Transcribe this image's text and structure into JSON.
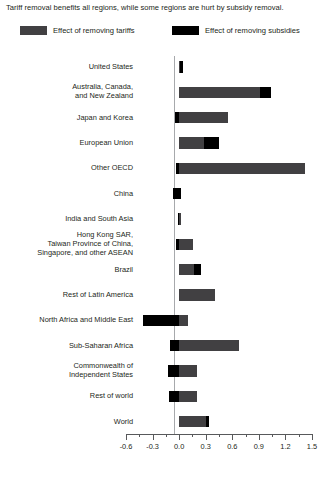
{
  "title": "Tariff removal benefits all regions, while some regions are hurt by subsidy removal.",
  "legend": {
    "items": [
      {
        "label": "Effect of removing tariffs",
        "color": "#414042",
        "key": "tariffs"
      },
      {
        "label": "Effect of removing subsidies",
        "color": "#000000",
        "key": "subsidies"
      }
    ]
  },
  "chart_data": {
    "type": "bar",
    "orientation": "horizontal",
    "stacked": true,
    "title": "Tariff removal benefits all regions, while some regions are hurt by subsidy removal.",
    "xlabel": "",
    "ylabel": "",
    "xlim": [
      -0.6,
      1.5
    ],
    "xticks": [
      "-0.6",
      "-0.3",
      "0.0",
      "0.3",
      "0.6",
      "0.9",
      "1.2",
      "1.5"
    ],
    "xtick_values": [
      -0.6,
      -0.3,
      0.0,
      0.3,
      0.6,
      0.9,
      1.2,
      1.5
    ],
    "minor_tick_interval": 0.15,
    "grid": false,
    "legend_position": "top",
    "categories": [
      "United States",
      "Australia, Canada,\nand New Zealand",
      "Japan and Korea",
      "European Union",
      "Other OECD",
      "China",
      "India and South Asia",
      "Hong Kong SAR,\nTaiwan Province of China,\nSingapore, and other ASEAN",
      "Brazil",
      "Rest of Latin America",
      "North Africa and Middle East",
      "Sub-Saharan Africa",
      "Commonwealth of\nIndependent States",
      "Rest of world",
      "World"
    ],
    "series": [
      {
        "name": "Effect of removing tariffs",
        "color": "#414042",
        "values": [
          0.01,
          0.91,
          0.55,
          0.28,
          1.42,
          -0.01,
          0.02,
          0.16,
          0.17,
          0.41,
          0.09,
          0.68,
          0.2,
          0.2,
          0.3
        ]
      },
      {
        "name": "Effect of removing subsidies",
        "color": "#000000",
        "values": [
          0.03,
          0.13,
          -0.04,
          0.17,
          0.03,
          -0.06,
          0.01,
          0.0,
          0.07,
          0.0,
          -0.41,
          -0.1,
          -0.13,
          -0.11,
          0.03
        ]
      }
    ],
    "bars": [
      {
        "category": "United States",
        "gray_start": 0.0,
        "gray_end": 0.012,
        "black_start": 0.012,
        "black_end": 0.042
      },
      {
        "category": "Australia, Canada, and New Zealand",
        "gray_start": 0.0,
        "gray_end": 0.91,
        "black_start": 0.91,
        "black_end": 1.04
      },
      {
        "category": "Japan and Korea",
        "gray_start": 0.0,
        "gray_end": 0.55,
        "black_start": -0.045,
        "black_end": 0.0
      },
      {
        "category": "European Union",
        "gray_start": 0.0,
        "gray_end": 0.28,
        "black_start": 0.28,
        "black_end": 0.45
      },
      {
        "category": "Other OECD",
        "gray_start": 0.0,
        "gray_end": 1.42,
        "black_start": -0.03,
        "black_end": 0.0
      },
      {
        "category": "China",
        "gray_start": -0.01,
        "gray_end": 0.0,
        "black_start": -0.07,
        "black_end": 0.02
      },
      {
        "category": "India and South Asia",
        "gray_start": 0.0,
        "gray_end": 0.02,
        "black_start": -0.015,
        "black_end": 0.0
      },
      {
        "category": "Hong Kong SAR, Taiwan Province of China, Singapore, and other ASEAN",
        "gray_start": -0.03,
        "gray_end": 0.16,
        "black_start": -0.03,
        "black_end": 0.0
      },
      {
        "category": "Brazil",
        "gray_start": 0.0,
        "gray_end": 0.17,
        "black_start": 0.17,
        "black_end": 0.245
      },
      {
        "category": "Rest of Latin America",
        "gray_start": 0.0,
        "gray_end": 0.41,
        "black_start": 0.0,
        "black_end": 0.0
      },
      {
        "category": "North Africa and Middle East",
        "gray_start": 0.0,
        "gray_end": 0.095,
        "black_start": -0.41,
        "black_end": 0.0
      },
      {
        "category": "Sub-Saharan Africa",
        "gray_start": 0.0,
        "gray_end": 0.68,
        "black_start": -0.1,
        "black_end": 0.0
      },
      {
        "category": "Commonwealth of Independent States",
        "gray_start": 0.0,
        "gray_end": 0.2,
        "black_start": -0.13,
        "black_end": 0.0
      },
      {
        "category": "Rest of world",
        "gray_start": 0.0,
        "gray_end": 0.2,
        "black_start": -0.115,
        "black_end": 0.0
      },
      {
        "category": "World",
        "gray_start": 0.0,
        "gray_end": 0.305,
        "black_start": 0.305,
        "black_end": 0.335
      }
    ]
  }
}
